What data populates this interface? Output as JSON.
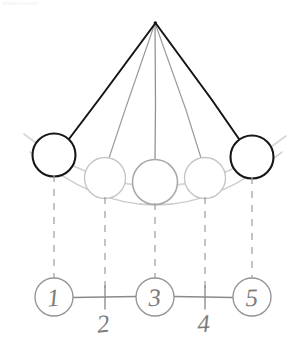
{
  "figure": {
    "watermark": "shutterstock",
    "style": "hand-drawn pencil sketch",
    "background_color": "#ffffff"
  },
  "colors": {
    "ink_dark": "#111111",
    "ink_mid": "#8a8a8a",
    "ink_light": "#c9c9c9",
    "ink_arc": "#cfcfcf",
    "ink_number": "#7c7c7c",
    "ink_axis": "#8a8a8a",
    "dashed": "#9a9a9a"
  },
  "pivot": {
    "label": "pivot",
    "x": 155,
    "y": 22
  },
  "strings": [
    {
      "id": "string-1",
      "to_ball": 1,
      "weight": "heavy",
      "color": "#111111"
    },
    {
      "id": "string-2",
      "to_ball": 2,
      "weight": "light",
      "color": "#9a9a9a"
    },
    {
      "id": "string-3",
      "to_ball": 3,
      "weight": "light",
      "color": "#8f8f8f"
    },
    {
      "id": "string-4",
      "to_ball": 4,
      "weight": "light",
      "color": "#9a9a9a"
    },
    {
      "id": "string-5",
      "to_ball": 5,
      "weight": "heavy",
      "color": "#111111"
    }
  ],
  "balls": [
    {
      "id": 1,
      "cx": 54,
      "cy": 155,
      "r": 21.5,
      "stroke": "#111111",
      "stroke_width": 2.1,
      "emphasis": "endpoint"
    },
    {
      "id": 2,
      "cx": 105,
      "cy": 178,
      "r": 20.5,
      "stroke": "#c2c2c2",
      "stroke_width": 1.3,
      "emphasis": "intermediate"
    },
    {
      "id": 3,
      "cx": 155,
      "cy": 182,
      "r": 22.5,
      "stroke": "#a6a6a6",
      "stroke_width": 1.5,
      "emphasis": "center"
    },
    {
      "id": 4,
      "cx": 205,
      "cy": 178,
      "r": 20.5,
      "stroke": "#c2c2c2",
      "stroke_width": 1.3,
      "emphasis": "intermediate"
    },
    {
      "id": 5,
      "cx": 252,
      "cy": 157,
      "r": 21.5,
      "stroke": "#111111",
      "stroke_width": 2.1,
      "emphasis": "endpoint"
    }
  ],
  "arcs": [
    {
      "id": "arc-upper",
      "description": "upper swept arc through ball centers",
      "color": "#d2d2d2"
    },
    {
      "id": "arc-lower",
      "description": "lower swept arc under balls",
      "color": "#cfcfcf"
    }
  ],
  "drop_lines": [
    {
      "from_ball": 1,
      "x": 54,
      "y1": 177,
      "y2": 279
    },
    {
      "from_ball": 2,
      "x": 105,
      "y1": 199,
      "y2": 292
    },
    {
      "from_ball": 3,
      "x": 155,
      "y1": 205,
      "y2": 279
    },
    {
      "from_ball": 4,
      "x": 205,
      "y1": 199,
      "y2": 292
    },
    {
      "from_ball": 5,
      "x": 252,
      "y1": 179,
      "y2": 279
    }
  ],
  "axis": {
    "y": 297,
    "x_start": 34,
    "x_end": 274,
    "color": "#8a8a8a"
  },
  "positions": [
    {
      "label": "1",
      "x": 54,
      "marker": "circle",
      "label_y": 297
    },
    {
      "label": "2",
      "x": 105,
      "marker": "tick",
      "label_y": 322
    },
    {
      "label": "3",
      "x": 155,
      "marker": "circle",
      "label_y": 297
    },
    {
      "label": "4",
      "x": 205,
      "marker": "tick",
      "label_y": 322
    },
    {
      "label": "5",
      "x": 252,
      "marker": "circle",
      "label_y": 297
    }
  ],
  "position_circle_radius": 19,
  "labels": {
    "p1": "1",
    "p2": "2",
    "p3": "3",
    "p4": "4",
    "p5": "5"
  }
}
